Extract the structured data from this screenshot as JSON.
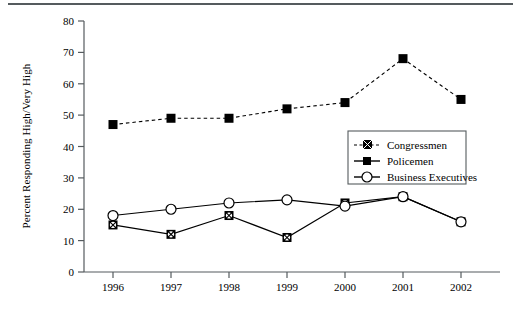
{
  "chart_data": {
    "type": "line",
    "title": "",
    "xlabel": "",
    "ylabel": "Percent Responding High/Very High",
    "categories": [
      "1996",
      "1997",
      "1998",
      "1999",
      "2000",
      "2001",
      "2002"
    ],
    "x": [
      1996,
      1997,
      1998,
      1999,
      2000,
      2001,
      2002
    ],
    "xlim": [
      1995.5,
      2002.5
    ],
    "ylim": [
      0,
      80
    ],
    "yticks": [
      0,
      10,
      20,
      30,
      40,
      50,
      60,
      70,
      80
    ],
    "ytick_labels": [
      "0",
      "10",
      "20",
      "30",
      "40",
      "50",
      "60",
      "70",
      "80"
    ],
    "grid": false,
    "legend_position": "center-right",
    "series": [
      {
        "name": "Congressmen",
        "values": [
          47,
          49,
          49,
          52,
          54,
          68,
          55
        ],
        "line_style": "dashed",
        "marker": "filled-square",
        "color": "#000000"
      },
      {
        "name": "Policemen",
        "values": [
          15,
          12,
          18,
          11,
          22,
          24,
          16
        ],
        "line_style": "solid",
        "marker": "crossed-circle",
        "color": "#000000"
      },
      {
        "name": "Business Executives",
        "values": [
          18,
          20,
          22,
          23,
          21,
          24,
          16
        ],
        "line_style": "solid",
        "marker": "open-circle",
        "color": "#000000"
      }
    ]
  },
  "legend": {
    "entries": [
      {
        "label": "Congressmen"
      },
      {
        "label": "Policemen"
      },
      {
        "label": "Business Executives"
      }
    ]
  },
  "axes": {
    "y_title": "Percent Responding High/Very High"
  }
}
